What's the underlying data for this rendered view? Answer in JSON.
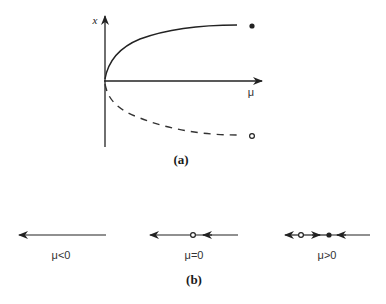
{
  "panel_a": {
    "caption": "(a)",
    "y_axis_label": "x",
    "x_axis_label": "μ",
    "branches": [
      {
        "name": "stable branch",
        "style": "solid",
        "marker": "filled-dot"
      },
      {
        "name": "unstable branch",
        "style": "dashed",
        "marker": "open-dot"
      }
    ]
  },
  "panel_b": {
    "caption": "(b)",
    "phase_lines": [
      {
        "label": "μ<0",
        "fixed_points": []
      },
      {
        "label": "μ=0",
        "fixed_points": [
          "open"
        ]
      },
      {
        "label": "μ>0",
        "fixed_points": [
          "open",
          "filled"
        ]
      }
    ]
  },
  "colors": {
    "ink": "#222222",
    "background": "#ffffff"
  }
}
